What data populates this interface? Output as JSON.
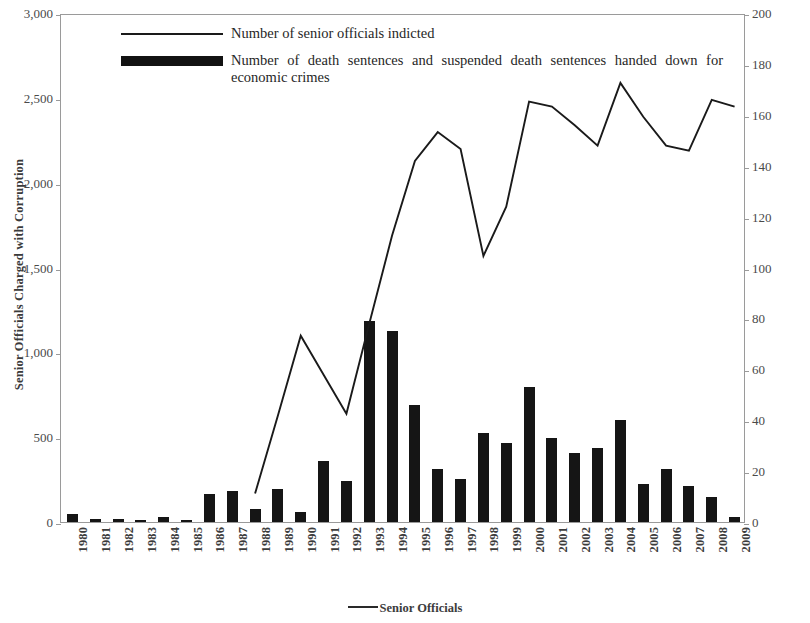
{
  "legend": {
    "series_line_label": "Number of senior officials indicted",
    "series_bar_label": "Number of death sentences and suspended death sentences handed down for economic crimes",
    "bottom_label": "Senior Officials",
    "line_key_icon": "line-key-icon",
    "bar_key_icon": "bar-key-icon"
  },
  "axes": {
    "left_title": "Senior Officials Charged with Corruption",
    "right_title": "Death Sentences and Suspended Death Sentences for Economic Crimes",
    "left_ticks": [
      "3,000",
      "2,500",
      "2,000",
      "1,500",
      "1,000",
      "500",
      "0"
    ],
    "right_ticks": [
      "200",
      "180",
      "160",
      "140",
      "120",
      "100",
      "80",
      "60",
      "40",
      "20",
      "0"
    ]
  },
  "chart_data": {
    "type": "bar",
    "title": "",
    "xlabel": "",
    "ylabel": "Senior Officials Charged with Corruption",
    "y2label": "Death Sentences and Suspended Death Sentences for Economic Crimes",
    "ylim": [
      0,
      3000
    ],
    "y2lim": [
      0,
      200
    ],
    "grid": false,
    "legend_position": "top-left-inside",
    "categories": [
      "1980",
      "1981",
      "1982",
      "1983",
      "1984",
      "1985",
      "1986",
      "1987",
      "1988",
      "1989",
      "1990",
      "1991",
      "1992",
      "1993",
      "1994",
      "1995",
      "1996",
      "1997",
      "1998",
      "1999",
      "2000",
      "2001",
      "2002",
      "2003",
      "2004",
      "2005",
      "2006",
      "2007",
      "2008",
      "2009"
    ],
    "series": [
      {
        "name": "Number of death sentences and suspended death sentences handed down for economic crimes",
        "type": "bar",
        "axis": "right",
        "values": [
          3,
          1,
          1,
          0,
          2,
          0,
          11,
          12,
          5,
          13,
          4,
          24,
          16,
          79,
          75,
          46,
          21,
          17,
          35,
          31,
          53,
          33,
          27,
          29,
          40,
          15,
          21,
          14,
          10,
          2
        ]
      },
      {
        "name": "Number of senior officials indicted",
        "type": "line",
        "axis": "left",
        "values": [
          null,
          null,
          null,
          null,
          null,
          null,
          null,
          null,
          180,
          640,
          1110,
          880,
          650,
          1180,
          1700,
          2140,
          2310,
          2210,
          1580,
          1870,
          2490,
          2460,
          2350,
          2230,
          2600,
          2400,
          2230,
          2200,
          2500,
          2460
        ]
      }
    ]
  }
}
